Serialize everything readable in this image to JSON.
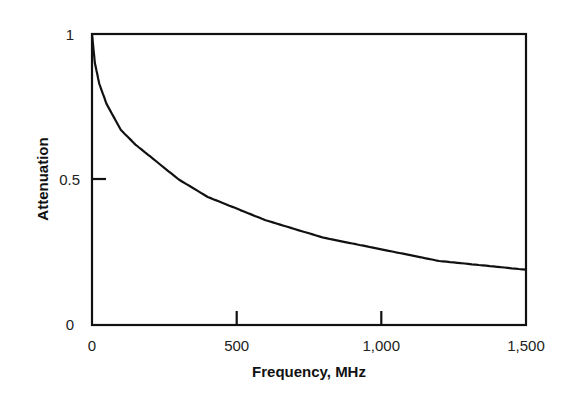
{
  "chart_data": {
    "type": "line",
    "title": "",
    "xlabel": "Frequency, MHz",
    "ylabel": "Attenuation",
    "xlim": [
      0,
      1500
    ],
    "ylim": [
      0,
      1
    ],
    "x_ticks": [
      "0",
      "500",
      "1,000",
      "1,500"
    ],
    "y_ticks": [
      "0",
      "0.5",
      "1"
    ],
    "grid": false,
    "legend": null,
    "series": [
      {
        "name": "Attenuation",
        "x": [
          0,
          10,
          25,
          50,
          100,
          150,
          200,
          300,
          400,
          500,
          600,
          700,
          800,
          900,
          1000,
          1100,
          1200,
          1300,
          1400,
          1500
        ],
        "values": [
          1.0,
          0.9,
          0.83,
          0.76,
          0.67,
          0.62,
          0.58,
          0.5,
          0.44,
          0.4,
          0.36,
          0.33,
          0.3,
          0.28,
          0.26,
          0.24,
          0.22,
          0.21,
          0.2,
          0.19
        ]
      }
    ]
  },
  "labels": {
    "xlabel": "Frequency, MHz",
    "ylabel": "Attenuation",
    "x0": "0",
    "x500": "500",
    "x1000": "1,000",
    "x1500": "1,500",
    "y0": "0",
    "y05": "0.5",
    "y1": "1"
  }
}
